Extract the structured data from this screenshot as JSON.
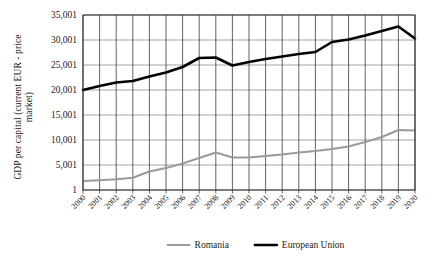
{
  "chart_data": {
    "type": "line",
    "title": "",
    "xlabel": "",
    "ylabel": "GDP per capital (current EUR - price market)",
    "ylabel_line1": "GDP per capital (current EUR - price",
    "ylabel_line2": "market)",
    "grid": true,
    "legend_position": "bottom",
    "ylim": [
      1,
      35001
    ],
    "ytick_labels": [
      "1",
      "5,001",
      "10,001",
      "15,001",
      "20,001",
      "25,001",
      "30,001",
      "35,001"
    ],
    "ytick_values": [
      1,
      5001,
      10001,
      15001,
      20001,
      25001,
      30001,
      35001
    ],
    "categories": [
      "2000",
      "2001",
      "2002",
      "2003",
      "2004",
      "2005",
      "2006",
      "2007",
      "2008",
      "2009",
      "2010",
      "2011",
      "2012",
      "2013",
      "2014",
      "2015",
      "2016",
      "2017",
      "2018",
      "2019",
      "2020"
    ],
    "series": [
      {
        "name": "Romania",
        "color": "#9a9a9a",
        "values": [
          1800,
          1950,
          2150,
          2450,
          3700,
          4400,
          5300,
          6400,
          7500,
          6500,
          6500,
          6800,
          7100,
          7500,
          7800,
          8200,
          8700,
          9600,
          10600,
          12000,
          11900
        ]
      },
      {
        "name": "European Union",
        "color": "#000000",
        "values": [
          20000,
          20800,
          21500,
          21800,
          22700,
          23500,
          24600,
          26400,
          26500,
          24900,
          25600,
          26200,
          26700,
          27200,
          27600,
          29600,
          30100,
          30900,
          31800,
          32700,
          30300
        ]
      }
    ]
  },
  "legend": {
    "items": [
      {
        "label": "Romania",
        "color": "#9a9a9a"
      },
      {
        "label": "European Union",
        "color": "#000000"
      }
    ]
  }
}
